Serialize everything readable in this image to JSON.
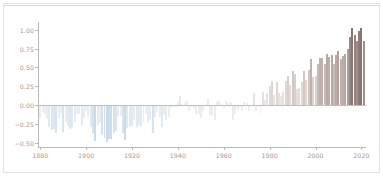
{
  "figure": {
    "background_color": "#ffffff",
    "border_color": "#e3e3e3",
    "axis_color": "#b9b9b9",
    "tick_label_color": "#9a9a9a"
  },
  "chart_data": {
    "type": "bar",
    "title": "",
    "subtitle": "",
    "xlabel": "",
    "ylabel": "",
    "xlim": [
      1879,
      2022
    ],
    "ylim": [
      -0.55,
      1.1
    ],
    "grid": false,
    "legend": null,
    "y_ticks": [
      "1.00",
      "0.75",
      "0.50",
      "0.25",
      "0.00",
      "−0.25",
      "−0.50"
    ],
    "y_tick_values": [
      1.0,
      0.75,
      0.5,
      0.25,
      0.0,
      -0.25,
      -0.5
    ],
    "x_ticks": [
      "1880",
      "1900",
      "1920",
      "1940",
      "1960",
      "1980",
      "2000",
      "2020"
    ],
    "x_tick_values": [
      1880,
      1900,
      1920,
      1940,
      1960,
      1980,
      2000,
      2020
    ],
    "colormap": {
      "negative_extreme": "#c8d8e4",
      "negative_mild": "#dde7ee",
      "zero": "#efefef",
      "positive_mild": "#d8cdc9",
      "positive_strong": "#b0a09a",
      "positive_extreme": "#8f7d78"
    },
    "x": [
      1880,
      1881,
      1882,
      1883,
      1884,
      1885,
      1886,
      1887,
      1888,
      1889,
      1890,
      1891,
      1892,
      1893,
      1894,
      1895,
      1896,
      1897,
      1898,
      1899,
      1900,
      1901,
      1902,
      1903,
      1904,
      1905,
      1906,
      1907,
      1908,
      1909,
      1910,
      1911,
      1912,
      1913,
      1914,
      1915,
      1916,
      1917,
      1918,
      1919,
      1920,
      1921,
      1922,
      1923,
      1924,
      1925,
      1926,
      1927,
      1928,
      1929,
      1930,
      1931,
      1932,
      1933,
      1934,
      1935,
      1936,
      1937,
      1938,
      1939,
      1940,
      1941,
      1942,
      1943,
      1944,
      1945,
      1946,
      1947,
      1948,
      1949,
      1950,
      1951,
      1952,
      1953,
      1954,
      1955,
      1956,
      1957,
      1958,
      1959,
      1960,
      1961,
      1962,
      1963,
      1964,
      1965,
      1966,
      1967,
      1968,
      1969,
      1970,
      1971,
      1972,
      1973,
      1974,
      1975,
      1976,
      1977,
      1978,
      1979,
      1980,
      1981,
      1982,
      1983,
      1984,
      1985,
      1986,
      1987,
      1988,
      1989,
      1990,
      1991,
      1992,
      1993,
      1994,
      1995,
      1996,
      1997,
      1998,
      1999,
      2000,
      2001,
      2002,
      2003,
      2004,
      2005,
      2006,
      2007,
      2008,
      2009,
      2010,
      2011,
      2012,
      2013,
      2014,
      2015,
      2016,
      2017,
      2018,
      2019,
      2020,
      2021
    ],
    "values": [
      -0.17,
      -0.09,
      -0.11,
      -0.18,
      -0.28,
      -0.33,
      -0.31,
      -0.36,
      -0.17,
      -0.1,
      -0.35,
      -0.22,
      -0.27,
      -0.31,
      -0.3,
      -0.22,
      -0.11,
      -0.11,
      -0.27,
      -0.17,
      -0.08,
      -0.15,
      -0.28,
      -0.37,
      -0.47,
      -0.26,
      -0.22,
      -0.39,
      -0.43,
      -0.48,
      -0.44,
      -0.44,
      -0.36,
      -0.34,
      -0.15,
      -0.14,
      -0.36,
      -0.46,
      -0.3,
      -0.28,
      -0.27,
      -0.19,
      -0.28,
      -0.26,
      -0.27,
      -0.22,
      -0.11,
      -0.22,
      -0.2,
      -0.36,
      -0.16,
      -0.09,
      -0.16,
      -0.29,
      -0.13,
      -0.2,
      -0.15,
      -0.03,
      -0.02,
      -0.02,
      0.05,
      0.12,
      0.02,
      0.03,
      0.06,
      -0.07,
      -0.02,
      -0.05,
      -0.11,
      -0.11,
      -0.17,
      -0.07,
      0.01,
      0.08,
      -0.13,
      -0.14,
      -0.19,
      0.05,
      0.06,
      0.03,
      -0.03,
      0.06,
      0.03,
      0.05,
      -0.2,
      -0.11,
      -0.06,
      -0.02,
      -0.08,
      0.05,
      0.03,
      -0.08,
      0.01,
      0.16,
      -0.07,
      -0.01,
      -0.1,
      0.18,
      0.07,
      0.16,
      0.26,
      0.32,
      0.14,
      0.31,
      0.16,
      0.12,
      0.18,
      0.32,
      0.39,
      0.27,
      0.45,
      0.41,
      0.22,
      0.23,
      0.31,
      0.45,
      0.33,
      0.46,
      0.61,
      0.38,
      0.39,
      0.54,
      0.63,
      0.62,
      0.54,
      0.68,
      0.64,
      0.67,
      0.54,
      0.66,
      0.72,
      0.61,
      0.65,
      0.68,
      0.75,
      0.9,
      1.02,
      0.93,
      0.85,
      0.98,
      1.02,
      0.85
    ]
  }
}
